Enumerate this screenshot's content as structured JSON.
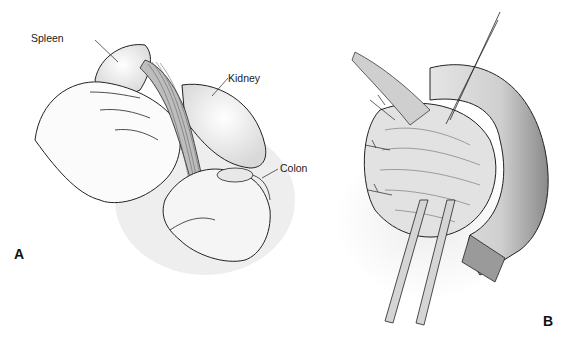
{
  "figure": {
    "panel_a": {
      "letter": "A",
      "labels": {
        "spleen": "Spleen",
        "kidney": "Kidney",
        "colon": "Colon"
      }
    },
    "panel_b": {
      "letter": "B"
    }
  }
}
